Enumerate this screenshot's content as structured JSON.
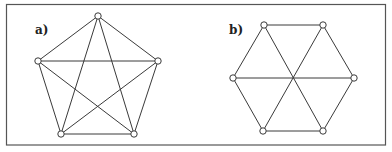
{
  "figure": {
    "colors": {
      "edge": "#3a3a3a",
      "node_fill": "#ffffff",
      "frame": "#555555"
    },
    "panels": [
      {
        "id": "a",
        "label": "a)",
        "graph_type": "complete graph K5",
        "nodes": [
          "top",
          "left",
          "right",
          "bottom-left",
          "bottom-right"
        ],
        "edges": [
          [
            "top",
            "left"
          ],
          [
            "top",
            "right"
          ],
          [
            "top",
            "bottom-left"
          ],
          [
            "top",
            "bottom-right"
          ],
          [
            "left",
            "right"
          ],
          [
            "left",
            "bottom-left"
          ],
          [
            "left",
            "bottom-right"
          ],
          [
            "right",
            "bottom-left"
          ],
          [
            "right",
            "bottom-right"
          ],
          [
            "bottom-left",
            "bottom-right"
          ]
        ]
      },
      {
        "id": "b",
        "label": "b)",
        "graph_type": "hexagon with three diagonals through center",
        "nodes": [
          "top-left",
          "top-right",
          "left",
          "right",
          "bottom-left",
          "bottom-right"
        ],
        "edges": [
          [
            "top-left",
            "top-right"
          ],
          [
            "top-right",
            "right"
          ],
          [
            "right",
            "bottom-right"
          ],
          [
            "bottom-right",
            "bottom-left"
          ],
          [
            "bottom-left",
            "left"
          ],
          [
            "left",
            "top-left"
          ],
          [
            "left",
            "right"
          ],
          [
            "top-left",
            "bottom-right"
          ],
          [
            "top-right",
            "bottom-left"
          ]
        ]
      }
    ]
  }
}
